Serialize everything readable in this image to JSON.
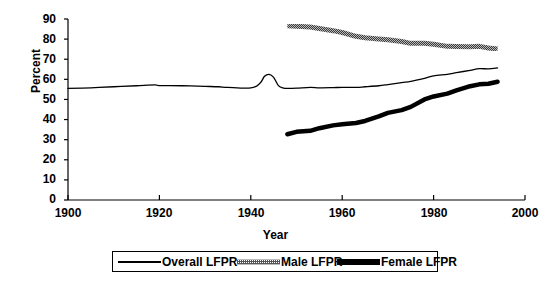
{
  "chart_data": {
    "type": "line",
    "title": "",
    "xlabel": "Year",
    "ylabel": "Percent",
    "xlim": [
      1900,
      2000
    ],
    "ylim": [
      0,
      90
    ],
    "xticks": [
      1900,
      1920,
      1940,
      1960,
      1980,
      2000
    ],
    "ytick_labels": [
      "90",
      "80",
      "70",
      "60",
      "50",
      "40",
      "30",
      "20",
      "10",
      "0"
    ],
    "yticks": [
      90,
      80,
      70,
      60,
      50,
      40,
      30,
      20,
      10,
      0
    ],
    "grid": false,
    "legend_position": "bottom",
    "series": [
      {
        "name": "Overall LFPR",
        "style": "thin-solid",
        "color": "#000000",
        "x": [
          1900,
          1905,
          1910,
          1915,
          1919,
          1920,
          1925,
          1930,
          1933,
          1935,
          1940,
          1942,
          1943,
          1944,
          1945,
          1946,
          1947,
          1948,
          1950,
          1953,
          1955,
          1958,
          1960,
          1963,
          1965,
          1968,
          1970,
          1973,
          1975,
          1978,
          1980,
          1983,
          1985,
          1988,
          1990,
          1992,
          1994
        ],
        "y": [
          55.5,
          55.8,
          56.3,
          56.8,
          57.2,
          56.9,
          56.8,
          56.5,
          56.3,
          56.0,
          55.7,
          58.0,
          61.5,
          62.5,
          61.0,
          57.0,
          55.8,
          55.5,
          55.6,
          56.0,
          55.8,
          55.9,
          56.0,
          56.0,
          56.3,
          56.8,
          57.4,
          58.4,
          59.0,
          60.5,
          61.7,
          62.5,
          63.3,
          64.5,
          65.3,
          65.2,
          65.7
        ]
      },
      {
        "name": "Male LFPR",
        "style": "dotted-thick",
        "color": "#666666",
        "x": [
          1948,
          1950,
          1953,
          1955,
          1958,
          1960,
          1963,
          1965,
          1968,
          1970,
          1973,
          1975,
          1978,
          1980,
          1983,
          1985,
          1988,
          1990,
          1992,
          1994
        ],
        "y": [
          86.6,
          86.4,
          86.0,
          85.3,
          84.2,
          83.3,
          81.4,
          80.7,
          80.1,
          79.7,
          78.8,
          77.9,
          77.9,
          77.4,
          76.4,
          76.3,
          76.2,
          76.4,
          75.6,
          75.1
        ]
      },
      {
        "name": "Female LFPR",
        "style": "thick-solid",
        "color": "#000000",
        "x": [
          1948,
          1950,
          1953,
          1955,
          1958,
          1960,
          1963,
          1965,
          1968,
          1970,
          1973,
          1975,
          1978,
          1980,
          1983,
          1985,
          1988,
          1990,
          1992,
          1994
        ],
        "y": [
          32.7,
          33.9,
          34.4,
          35.7,
          37.1,
          37.7,
          38.3,
          39.3,
          41.6,
          43.3,
          44.7,
          46.3,
          50.0,
          51.5,
          52.9,
          54.5,
          56.6,
          57.5,
          57.8,
          58.8
        ]
      }
    ]
  },
  "legend": {
    "items": [
      {
        "label": "Overall LFPR",
        "swatch": "thin-line-swatch"
      },
      {
        "label": "Male LFPR",
        "swatch": "dotted-line-swatch"
      },
      {
        "label": "Female LFPR",
        "swatch": "thick-line-swatch"
      }
    ]
  },
  "axes": {
    "y_title": "Percent",
    "x_title": "Year",
    "y_ticks": [
      "90",
      "80",
      "70",
      "60",
      "50",
      "40",
      "30",
      "20",
      "10",
      "0"
    ],
    "x_ticks": [
      "1900",
      "1920",
      "1940",
      "1960",
      "1980",
      "2000"
    ]
  }
}
